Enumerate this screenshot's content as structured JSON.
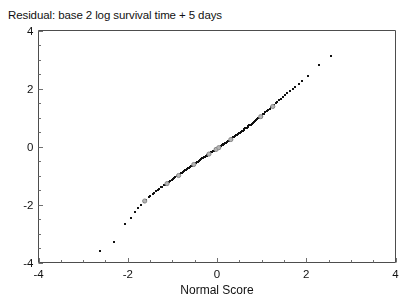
{
  "figure": {
    "title": "Residual: base 2 log survival time + 5 days",
    "x_axis_title": "Normal Score",
    "frame_color": "#4d4d4d",
    "point_color": "#111111",
    "highlight_point_color": "#b5b5b5",
    "highlight_point_edge": "#8a8a8a"
  },
  "chart_data": {
    "type": "scatter",
    "title": "Residual: base 2 log survival time + 5 days",
    "subtitle": "",
    "xlabel": "Normal Score",
    "ylabel": "",
    "xlim": [
      -4,
      4
    ],
    "ylim": [
      -4,
      4
    ],
    "xticks": [
      -4,
      -2,
      0,
      2,
      4
    ],
    "yticks": [
      -4,
      -2,
      0,
      2,
      4
    ],
    "xtick_labels": [
      "-4",
      "-2",
      "0",
      "2",
      "4"
    ],
    "ytick_labels": [
      "-4",
      "-2",
      "0",
      "2",
      "4"
    ],
    "minor_tick_step": 0.5,
    "grid": false,
    "legend": null,
    "legend_position": "none",
    "annotations": [],
    "series": [
      {
        "name": "residuals",
        "marker": "filled-square",
        "color": "#111111",
        "size": 2.4,
        "points": [
          [
            -2.62,
            -3.62
          ],
          [
            -2.3,
            -3.3
          ],
          [
            -2.05,
            -2.67
          ],
          [
            -1.92,
            -2.48
          ],
          [
            -1.84,
            -2.25
          ],
          [
            -1.76,
            -2.13
          ],
          [
            -1.7,
            -2.02
          ],
          [
            -1.64,
            -1.92
          ],
          [
            -1.58,
            -1.84
          ],
          [
            -1.53,
            -1.76
          ],
          [
            -1.49,
            -1.7
          ],
          [
            -1.44,
            -1.65
          ],
          [
            -1.4,
            -1.6
          ],
          [
            -1.36,
            -1.55
          ],
          [
            -1.32,
            -1.5
          ],
          [
            -1.29,
            -1.46
          ],
          [
            -1.25,
            -1.42
          ],
          [
            -1.22,
            -1.39
          ],
          [
            -1.19,
            -1.35
          ],
          [
            -1.15,
            -1.32
          ],
          [
            -1.12,
            -1.28
          ],
          [
            -1.09,
            -1.25
          ],
          [
            -1.06,
            -1.22
          ],
          [
            -1.04,
            -1.19
          ],
          [
            -1.01,
            -1.16
          ],
          [
            -0.98,
            -1.13
          ],
          [
            -0.95,
            -1.1
          ],
          [
            -0.93,
            -1.07
          ],
          [
            -0.9,
            -1.04
          ],
          [
            -0.88,
            -1.01
          ],
          [
            -0.85,
            -0.99
          ],
          [
            -0.83,
            -0.96
          ],
          [
            -0.8,
            -0.93
          ],
          [
            -0.78,
            -0.91
          ],
          [
            -0.76,
            -0.88
          ],
          [
            -0.73,
            -0.86
          ],
          [
            -0.71,
            -0.83
          ],
          [
            -0.69,
            -0.81
          ],
          [
            -0.67,
            -0.78
          ],
          [
            -0.64,
            -0.76
          ],
          [
            -0.62,
            -0.74
          ],
          [
            -0.6,
            -0.71
          ],
          [
            -0.58,
            -0.69
          ],
          [
            -0.56,
            -0.67
          ],
          [
            -0.54,
            -0.64
          ],
          [
            -0.52,
            -0.62
          ],
          [
            -0.5,
            -0.6
          ],
          [
            -0.47,
            -0.58
          ],
          [
            -0.45,
            -0.55
          ],
          [
            -0.43,
            -0.53
          ],
          [
            -0.41,
            -0.51
          ],
          [
            -0.39,
            -0.49
          ],
          [
            -0.37,
            -0.47
          ],
          [
            -0.35,
            -0.44
          ],
          [
            -0.33,
            -0.42
          ],
          [
            -0.31,
            -0.4
          ],
          [
            -0.29,
            -0.38
          ],
          [
            -0.27,
            -0.36
          ],
          [
            -0.25,
            -0.34
          ],
          [
            -0.23,
            -0.32
          ],
          [
            -0.21,
            -0.3
          ],
          [
            -0.19,
            -0.27
          ],
          [
            -0.17,
            -0.25
          ],
          [
            -0.15,
            -0.23
          ],
          [
            -0.13,
            -0.21
          ],
          [
            -0.11,
            -0.19
          ],
          [
            -0.09,
            -0.17
          ],
          [
            -0.07,
            -0.15
          ],
          [
            -0.05,
            -0.13
          ],
          [
            -0.03,
            -0.11
          ],
          [
            -0.01,
            -0.09
          ],
          [
            0.01,
            -0.07
          ],
          [
            0.03,
            -0.05
          ],
          [
            0.05,
            -0.03
          ],
          [
            0.07,
            -0.01
          ],
          [
            0.09,
            0.01
          ],
          [
            0.11,
            0.03
          ],
          [
            0.13,
            0.05
          ],
          [
            0.15,
            0.07
          ],
          [
            0.17,
            0.09
          ],
          [
            0.19,
            0.11
          ],
          [
            0.21,
            0.13
          ],
          [
            0.23,
            0.16
          ],
          [
            0.25,
            0.18
          ],
          [
            0.27,
            0.2
          ],
          [
            0.29,
            0.22
          ],
          [
            0.31,
            0.24
          ],
          [
            0.33,
            0.26
          ],
          [
            0.35,
            0.29
          ],
          [
            0.37,
            0.31
          ],
          [
            0.39,
            0.33
          ],
          [
            0.41,
            0.35
          ],
          [
            0.43,
            0.38
          ],
          [
            0.45,
            0.4
          ],
          [
            0.47,
            0.42
          ],
          [
            0.5,
            0.45
          ],
          [
            0.52,
            0.47
          ],
          [
            0.54,
            0.49
          ],
          [
            0.56,
            0.52
          ],
          [
            0.58,
            0.54
          ],
          [
            0.6,
            0.57
          ],
          [
            0.62,
            0.59
          ],
          [
            0.64,
            0.62
          ],
          [
            0.67,
            0.64
          ],
          [
            0.69,
            0.67
          ],
          [
            0.71,
            0.7
          ],
          [
            0.73,
            0.72
          ],
          [
            0.76,
            0.75
          ],
          [
            0.78,
            0.78
          ],
          [
            0.8,
            0.81
          ],
          [
            0.83,
            0.84
          ],
          [
            0.85,
            0.87
          ],
          [
            0.88,
            0.9
          ],
          [
            0.9,
            0.93
          ],
          [
            0.93,
            0.96
          ],
          [
            0.95,
            0.99
          ],
          [
            0.98,
            1.03
          ],
          [
            1.01,
            1.06
          ],
          [
            1.04,
            1.1
          ],
          [
            1.06,
            1.13
          ],
          [
            1.09,
            1.17
          ],
          [
            1.12,
            1.21
          ],
          [
            1.15,
            1.25
          ],
          [
            1.19,
            1.29
          ],
          [
            1.22,
            1.34
          ],
          [
            1.25,
            1.38
          ],
          [
            1.29,
            1.43
          ],
          [
            1.32,
            1.48
          ],
          [
            1.36,
            1.53
          ],
          [
            1.4,
            1.58
          ],
          [
            1.44,
            1.64
          ],
          [
            1.49,
            1.7
          ],
          [
            1.53,
            1.76
          ],
          [
            1.58,
            1.83
          ],
          [
            1.64,
            1.9
          ],
          [
            1.7,
            1.97
          ],
          [
            1.76,
            2.06
          ],
          [
            1.84,
            2.15
          ],
          [
            1.92,
            2.26
          ],
          [
            2.05,
            2.42
          ],
          [
            2.3,
            2.8
          ],
          [
            2.55,
            3.1
          ]
        ]
      },
      {
        "name": "censored",
        "marker": "open-circle",
        "color": "#b5b5b5",
        "size": 4.2,
        "points": [
          [
            -1.62,
            -1.88
          ],
          [
            -1.12,
            -1.28
          ],
          [
            -0.86,
            -1.0
          ],
          [
            -0.52,
            -0.62
          ],
          [
            -0.18,
            -0.26
          ],
          [
            -0.02,
            -0.1
          ],
          [
            0.04,
            -0.04
          ],
          [
            0.31,
            0.24
          ],
          [
            0.98,
            1.03
          ],
          [
            1.25,
            1.38
          ]
        ]
      }
    ]
  },
  "ticks": {
    "y_labels": [
      "4",
      "2",
      "0",
      "-2",
      "-4"
    ],
    "y_values": [
      4,
      2,
      0,
      -2,
      -4
    ],
    "x_labels": [
      "-4",
      "-2",
      "0",
      "2",
      "4"
    ],
    "x_values": [
      -4,
      -2,
      0,
      2,
      4
    ]
  }
}
